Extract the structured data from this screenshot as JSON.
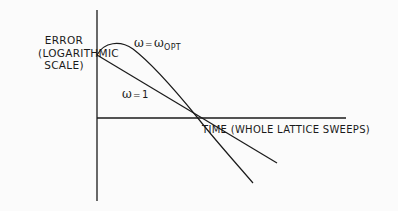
{
  "diagram": {
    "type": "convergence-sketch",
    "y_axis_label": [
      "ERROR",
      "(LOGARITHMIC",
      "SCALE)"
    ],
    "x_axis_label": "TIME (WHOLE LATTICE SWEEPS)",
    "curves": [
      {
        "name": "omega-opt",
        "label_symbol": "ω",
        "label_eq": "=",
        "label_rhs": "ω",
        "label_sub": "OPT",
        "shape": "rises to a hump, then falls steeply"
      },
      {
        "name": "omega-one",
        "label_symbol": "ω",
        "label_eq": "=",
        "label_rhs": "1",
        "shape": "straight line decreasing"
      }
    ],
    "colors": {
      "ink": "#1a1a1a",
      "paper": "#fbfbfb"
    }
  }
}
